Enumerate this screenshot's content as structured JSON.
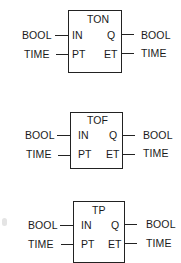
{
  "blocks": [
    {
      "name": "TON",
      "inputs": [
        {
          "pin": "IN",
          "type": "BOOL"
        },
        {
          "pin": "PT",
          "type": "TIME"
        }
      ],
      "outputs": [
        {
          "pin": "Q",
          "type": "BOOL"
        },
        {
          "pin": "ET",
          "type": "TIME"
        }
      ]
    },
    {
      "name": "TOF",
      "inputs": [
        {
          "pin": "IN",
          "type": "BOOL"
        },
        {
          "pin": "PT",
          "type": "TIME"
        }
      ],
      "outputs": [
        {
          "pin": "Q",
          "type": "BOOL"
        },
        {
          "pin": "ET",
          "type": "TIME"
        }
      ]
    },
    {
      "name": "TP",
      "inputs": [
        {
          "pin": "IN",
          "type": "BOOL"
        },
        {
          "pin": "PT",
          "type": "TIME"
        }
      ],
      "outputs": [
        {
          "pin": "Q",
          "type": "BOOL"
        },
        {
          "pin": "ET",
          "type": "TIME"
        }
      ]
    }
  ]
}
